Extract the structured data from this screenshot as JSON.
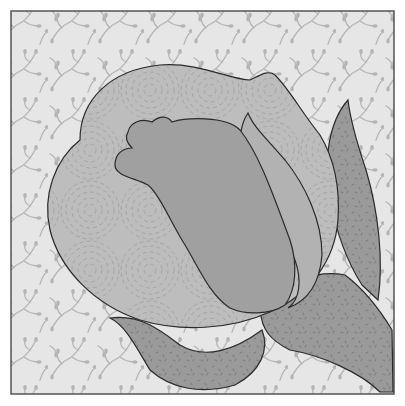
{
  "illustration": {
    "subject": "rose-bud quilt block",
    "colors": {
      "page": "#ffffff",
      "background_fabric": "#e6e6e6",
      "background_motif": "#b4b4b4",
      "outer_petal": "#bdbdbd",
      "outer_petal_swirl": "#a4a4a4",
      "inner_petal": "#a0a0a0",
      "middle_petal": "#b2b2b2",
      "leaf": "#9a9a9a",
      "leaf_speckle": "#7e7e7e",
      "outline": "#2a2a2a",
      "frame": "#555555"
    }
  }
}
